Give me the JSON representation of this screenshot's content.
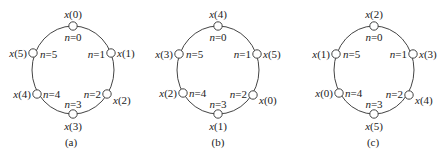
{
  "diagram": {
    "type": "circular sequence shift illustration",
    "stroke_color": "#444444",
    "node_fill": "#ffffff",
    "panels": [
      {
        "id": "a",
        "caption": "(a)",
        "n_labels": [
          "n=0",
          "n=1",
          "n=2",
          "n=3",
          "n=4",
          "n=5"
        ],
        "x_labels": [
          "x(0)",
          "x(1)",
          "x(2)",
          "x(3)",
          "x(4)",
          "x(5)"
        ]
      },
      {
        "id": "b",
        "caption": "(b)",
        "n_labels": [
          "n=0",
          "n=1",
          "n=2",
          "n=3",
          "n=4",
          "n=5"
        ],
        "x_labels": [
          "x(4)",
          "x(5)",
          "x(0)",
          "x(1)",
          "x(2)",
          "x(3)"
        ]
      },
      {
        "id": "c",
        "caption": "(c)",
        "n_labels": [
          "n=0",
          "n=1",
          "n=2",
          "n=3",
          "n=4",
          "n=5"
        ],
        "x_labels": [
          "x(2)",
          "x(3)",
          "x(4)",
          "x(5)",
          "x(0)",
          "x(1)"
        ]
      }
    ]
  }
}
